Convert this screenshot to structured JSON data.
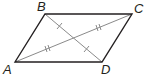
{
  "diagram": {
    "type": "parallelogram",
    "vertices": {
      "A": {
        "label": "A",
        "x": 15,
        "y": 62
      },
      "B": {
        "label": "B",
        "x": 45,
        "y": 14
      },
      "C": {
        "label": "C",
        "x": 132,
        "y": 14
      },
      "D": {
        "label": "D",
        "x": 102,
        "y": 62
      }
    },
    "sides": [
      "AB",
      "BC",
      "CD",
      "DA"
    ],
    "diagonals": [
      {
        "name": "AC",
        "tick_marks": 2
      },
      {
        "name": "BD",
        "tick_marks": 1
      }
    ],
    "colors": {
      "side": "#231f20",
      "diagonal": "#8a8a8a",
      "label": "#231f20"
    }
  }
}
